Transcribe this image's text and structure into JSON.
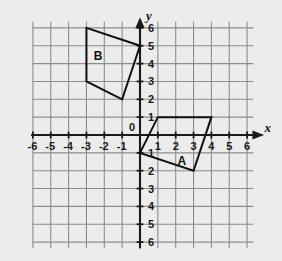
{
  "figure": {
    "background_color": "#ececec",
    "grid_color": "#8c8c8c",
    "axis_color": "#1a1a1a",
    "shape_color": "#111111"
  },
  "axes": {
    "x_name": "x",
    "y_name": "y",
    "x_tick_labels": [
      "-6",
      "-5",
      "-4",
      "-3",
      "-2",
      "-1",
      "1",
      "2",
      "3",
      "4",
      "5",
      "6"
    ],
    "y_tick_labels": [
      "6",
      "5",
      "4",
      "3",
      "2",
      "1",
      "1",
      "2",
      "3",
      "4",
      "5",
      "6"
    ],
    "origin_label": "0"
  },
  "shapes": [
    {
      "label": "A",
      "label_x": 2.35,
      "label_y": -1.45
    },
    {
      "label": "B",
      "label_x": -2.35,
      "label_y": 4.45
    }
  ],
  "chart_data": {
    "type": "scatter",
    "title": "",
    "xlabel": "x",
    "ylabel": "y",
    "xlim": [
      -6,
      6
    ],
    "ylim": [
      -6,
      6
    ],
    "xticks": [
      -6,
      -5,
      -4,
      -3,
      -2,
      -1,
      0,
      1,
      2,
      3,
      4,
      5,
      6
    ],
    "yticks": [
      -6,
      -5,
      -4,
      -3,
      -2,
      -1,
      0,
      1,
      2,
      3,
      4,
      5,
      6
    ],
    "grid": true,
    "legend": "none",
    "series": [
      {
        "name": "A",
        "kind": "polygon",
        "closed": true,
        "points": [
          [
            0,
            -1
          ],
          [
            1,
            1
          ],
          [
            4,
            1
          ],
          [
            3,
            -2
          ]
        ],
        "label_position": [
          2.35,
          -1.45
        ]
      },
      {
        "name": "B",
        "kind": "polygon",
        "closed": true,
        "points": [
          [
            -3,
            6
          ],
          [
            0,
            5
          ],
          [
            -1,
            2
          ],
          [
            -3,
            3
          ]
        ],
        "label_position": [
          -2.35,
          4.45
        ]
      }
    ]
  }
}
